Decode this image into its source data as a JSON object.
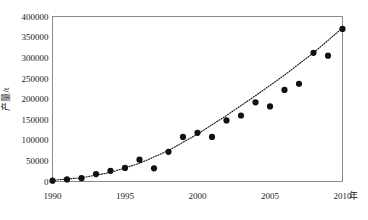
{
  "chart_data": {
    "type": "scatter",
    "title": "",
    "xlabel": "年",
    "ylabel": "产量/t",
    "xlim": [
      1990,
      2010
    ],
    "ylim": [
      0,
      400000
    ],
    "grid": false,
    "legend": null,
    "x_ticks": [
      "1990",
      "1995",
      "2000",
      "2005",
      "2010"
    ],
    "x_tick_values": [
      1990,
      1995,
      2000,
      2005,
      2010
    ],
    "y_ticks": [
      "0",
      "50000",
      "100000",
      "150000",
      "200000",
      "250000",
      "300000",
      "350000",
      "400000"
    ],
    "y_tick_values": [
      0,
      50000,
      100000,
      150000,
      200000,
      250000,
      300000,
      350000,
      400000
    ],
    "series": [
      {
        "name": "产量",
        "marker": "filled-circle",
        "x": [
          1990,
          1991,
          1992,
          1993,
          1994,
          1995,
          1996,
          1997,
          1998,
          1999,
          2000,
          2001,
          2002,
          2003,
          2004,
          2005,
          2006,
          2007,
          2008,
          2009,
          2010
        ],
        "values": [
          2000,
          5000,
          8000,
          18000,
          26000,
          33000,
          53000,
          32000,
          72000,
          108000,
          118000,
          108000,
          148000,
          160000,
          192000,
          182000,
          222000,
          237000,
          312000,
          305000,
          370000
        ]
      }
    ],
    "trend": {
      "name": "趋势线",
      "style": "dotted",
      "x": [
        1990,
        1992,
        1994,
        1996,
        1998,
        2000,
        2002,
        2004,
        2006,
        2008,
        2010
      ],
      "values": [
        3000,
        9000,
        22000,
        44000,
        75000,
        115000,
        160000,
        208000,
        258000,
        312000,
        372000
      ]
    }
  },
  "axis": {
    "y_title": "产量/t",
    "x_unit": "年"
  }
}
